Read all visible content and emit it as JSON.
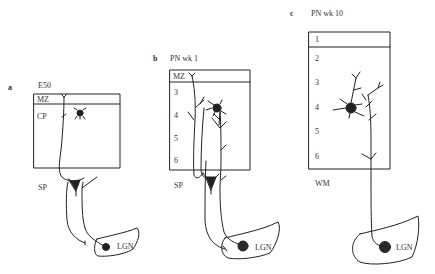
{
  "panels": [
    {
      "letter": "a",
      "title": "E50",
      "layers": [
        "MZ",
        "CP"
      ],
      "below_box": "SP",
      "target": "LGN"
    },
    {
      "letter": "b",
      "title": "PN wk 1",
      "layers": [
        "MZ",
        "3",
        "4",
        "5",
        "6"
      ],
      "below_box": "SP",
      "target": "LGN"
    },
    {
      "letter": "c",
      "title": "PN wk 10",
      "layers": [
        "1",
        "2",
        "3",
        "4",
        "5",
        "6"
      ],
      "below_box": "WM",
      "target": "LGN"
    }
  ],
  "colors": {
    "line": "#222222",
    "cell_body": "#2a2a2a",
    "background": "#ffffff"
  }
}
